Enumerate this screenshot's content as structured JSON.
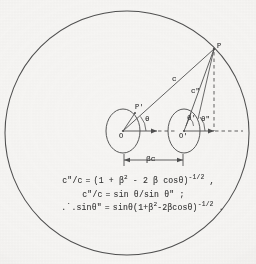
{
  "figure": {
    "name": "relativistic-aberration-diagram",
    "background_color": "#f6f5f3",
    "ink_color": "#4a4a4a",
    "boundary": {
      "shape": "circle",
      "center_x": 127,
      "center_y": 133,
      "radius": 122
    }
  },
  "points": {
    "observer_left": "O",
    "observer_right": "O'",
    "emission_left": "P'",
    "source_point": "P"
  },
  "angles": {
    "theta": "θ",
    "theta_prime": "θ'",
    "theta_double_prime": "θ\"",
    "theta_at_right_inner": "θ'"
  },
  "segments": {
    "c": "c",
    "c_double_prime": "c\""
  },
  "dimension": {
    "label": "βc",
    "from": "O",
    "to": "O'"
  },
  "equations": [
    {
      "id": "eq-1",
      "text": "c\"/c = (1 + β² - 2 β cosθ)⁻¹ᐟ² ,",
      "parts": {
        "lhs": "c\"/c",
        "rel": "=",
        "rhs": "(1 + β",
        "exp1": "2",
        "mid": " - 2 β cosθ)",
        "exp2": "-1/2",
        "tail": " ,"
      }
    },
    {
      "id": "eq-2",
      "text": "c\"/c = sin θ/sin θ\" ;",
      "parts": {
        "lhs": "c\"/c",
        "rel": "=",
        "rhs": "sin θ/sin θ\" ;"
      }
    },
    {
      "id": "eq-3",
      "text": "∴ sinθ\" = sinθ(1+β²-2βcosθ)⁻¹ᐟ² .",
      "parts": {
        "lead": ".˙.sinθ\"",
        "rel": "=",
        "rhs": "sinθ(1+β",
        "exp1": "2",
        "mid": "-2βcosθ)",
        "exp2": "-1/2",
        "tail": " ."
      }
    }
  ],
  "symbols": {
    "beta": "β",
    "theta": "θ",
    "c": "c"
  }
}
